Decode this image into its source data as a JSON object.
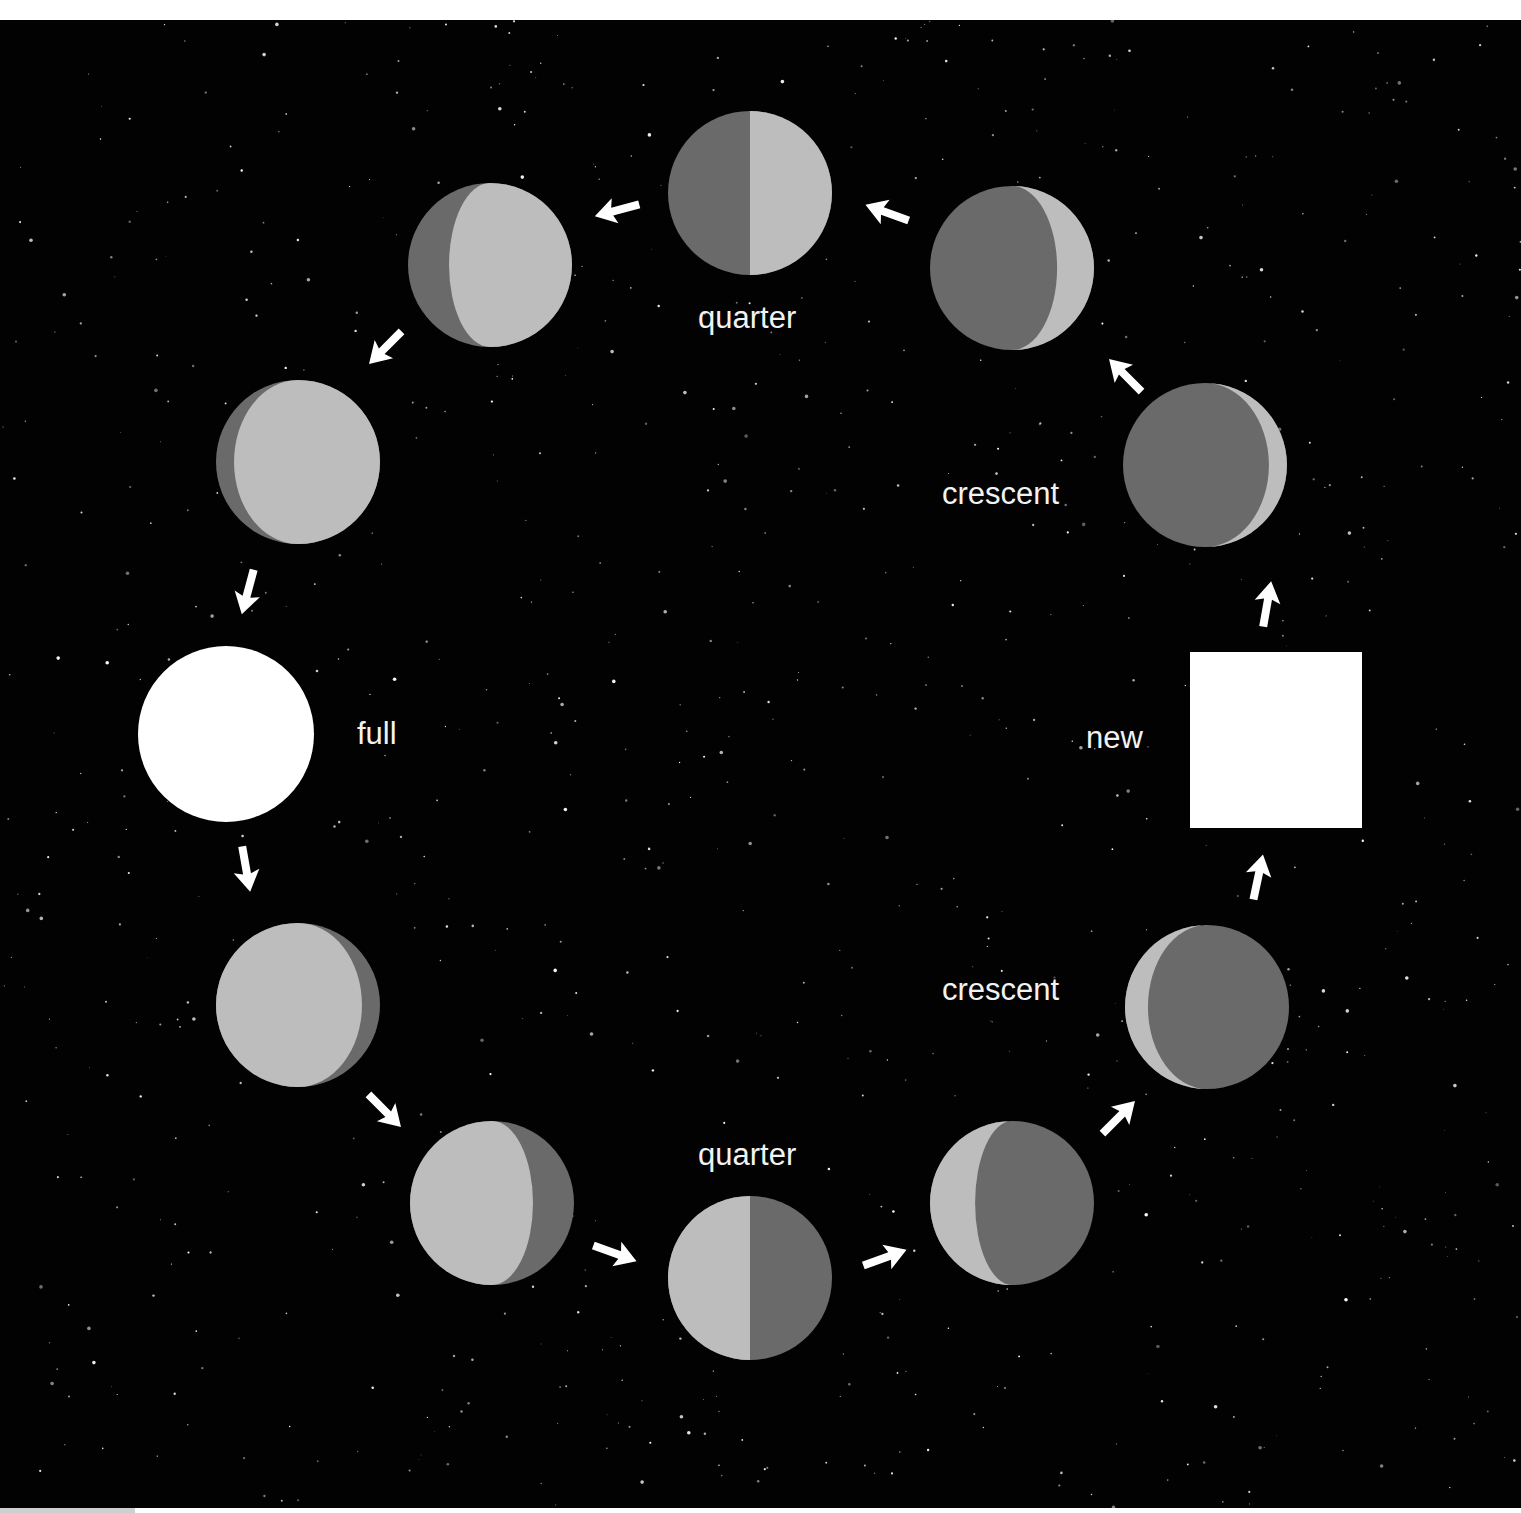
{
  "diagram": {
    "colors": {
      "background": "#020202",
      "lit": "#bdbdbd",
      "shadow": "#6a6a6a",
      "full": "#ffffff",
      "new": "#ffffff",
      "arrow": "#ffffff",
      "label": "#f2f2f2"
    },
    "labels": {
      "quarter_top": "quarter",
      "crescent_upper": "crescent",
      "new": "new",
      "full": "full",
      "crescent_lower": "crescent",
      "quarter_bottom": "quarter"
    },
    "phases": [
      {
        "id": "new",
        "shape": "square",
        "x": 1190,
        "y": 632,
        "w": 172,
        "h": 176
      },
      {
        "id": "crescent-lower-1",
        "cx": 1207,
        "cy": 987,
        "r": 82,
        "base": "shadow",
        "lit_side": "left",
        "k": -0.72
      },
      {
        "id": "crescent-lower-2",
        "cx": 1012,
        "cy": 1183,
        "r": 82,
        "base": "shadow",
        "lit_side": "left",
        "k": -0.45
      },
      {
        "id": "quarter-bottom",
        "cx": 750,
        "cy": 1258,
        "r": 82,
        "base": "split",
        "lit_side": "left",
        "k": 0
      },
      {
        "id": "gibbous-lower-1",
        "cx": 492,
        "cy": 1183,
        "r": 82,
        "base": "lit",
        "lit_side": "left",
        "k": 0.5
      },
      {
        "id": "gibbous-lower-2",
        "cx": 298,
        "cy": 985,
        "r": 82,
        "base": "lit",
        "lit_side": "left",
        "k": 0.78
      },
      {
        "id": "full",
        "shape": "full",
        "cx": 226,
        "cy": 714,
        "r": 88
      },
      {
        "id": "gibbous-upper-1",
        "cx": 298,
        "cy": 442,
        "r": 82,
        "base": "lit",
        "lit_side": "right",
        "k": 0.78
      },
      {
        "id": "gibbous-upper-2",
        "cx": 490,
        "cy": 245,
        "r": 82,
        "base": "lit",
        "lit_side": "right",
        "k": 0.5
      },
      {
        "id": "quarter-top",
        "cx": 750,
        "cy": 173,
        "r": 82,
        "base": "split",
        "lit_side": "right",
        "k": 0
      },
      {
        "id": "crescent-upper-1",
        "cx": 1012,
        "cy": 248,
        "r": 82,
        "base": "shadow",
        "lit_side": "right",
        "k": -0.55
      },
      {
        "id": "crescent-upper-2",
        "cx": 1205,
        "cy": 445,
        "r": 82,
        "base": "shadow",
        "lit_side": "right",
        "k": -0.78
      }
    ],
    "arrows": [
      {
        "id": "arrow-new-to-crescent-upper",
        "x": 1267,
        "y": 585,
        "angle": -80
      },
      {
        "id": "arrow-crescent-to-crescent",
        "x": 1126,
        "y": 356,
        "angle": -135
      },
      {
        "id": "arrow-crescent-to-quarter-top",
        "x": 888,
        "y": 193,
        "angle": -160
      },
      {
        "id": "arrow-quarter-to-gibbous",
        "x": 618,
        "y": 190,
        "angle": 165
      },
      {
        "id": "arrow-gibbous-to-gibbous-left",
        "x": 386,
        "y": 327,
        "angle": 135
      },
      {
        "id": "arrow-gibbous-to-full",
        "x": 248,
        "y": 571,
        "angle": 105
      },
      {
        "id": "arrow-full-to-gibbous",
        "x": 246,
        "y": 848,
        "angle": 80
      },
      {
        "id": "arrow-gibbous-to-gibbous-lower",
        "x": 384,
        "y": 1090,
        "angle": 45
      },
      {
        "id": "arrow-gibbous-to-quarter-bottom",
        "x": 614,
        "y": 1233,
        "angle": 20
      },
      {
        "id": "arrow-quarter-to-crescent",
        "x": 884,
        "y": 1238,
        "angle": -20
      },
      {
        "id": "arrow-crescent-to-crescent-lower",
        "x": 1118,
        "y": 1098,
        "angle": -45
      },
      {
        "id": "arrow-crescent-to-new",
        "x": 1258,
        "y": 858,
        "angle": -78
      }
    ]
  }
}
